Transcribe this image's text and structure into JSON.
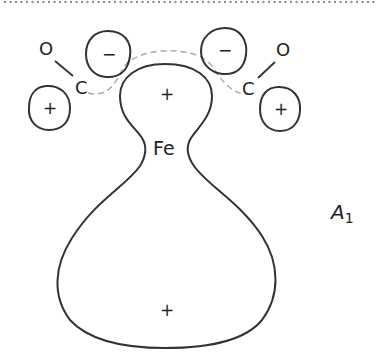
{
  "diagram": {
    "symmetry_label": {
      "main": "A",
      "subscript": "1"
    },
    "central_atom": {
      "label": "Fe"
    },
    "ligands": [
      {
        "carbon": "C",
        "oxygen": "O",
        "side": "left"
      },
      {
        "carbon": "C",
        "oxygen": "O",
        "side": "right"
      }
    ],
    "lobes": [
      {
        "id": "left-ligand-minus",
        "sign": "−"
      },
      {
        "id": "right-ligand-minus",
        "sign": "−"
      },
      {
        "id": "left-ligand-plus",
        "sign": "+"
      },
      {
        "id": "right-ligand-plus",
        "sign": "+"
      },
      {
        "id": "metal-upper",
        "sign": "+"
      },
      {
        "id": "metal-lower",
        "sign": "+"
      }
    ],
    "colors": {
      "stroke": "#333333",
      "dashed_overlap": "#aaaaaa",
      "top_border_dots": "#888888",
      "background": "#ffffff"
    }
  }
}
